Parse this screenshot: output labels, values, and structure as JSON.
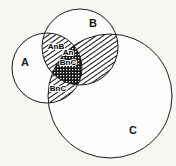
{
  "diagram": {
    "type": "venn-three-set",
    "title": "",
    "background_color": "#f7f6f3",
    "stroke_color": "#1a1a1a",
    "sets": [
      {
        "id": "A",
        "label": "A",
        "cx": 47,
        "cy": 68,
        "r": 35,
        "label_x": 25,
        "label_y": 63
      },
      {
        "id": "B",
        "label": "B",
        "cx": 80,
        "cy": 47,
        "r": 38,
        "label_x": 93,
        "label_y": 24
      },
      {
        "id": "C",
        "label": "C",
        "cx": 110,
        "cy": 96,
        "r": 62,
        "label_x": 133,
        "label_y": 131
      }
    ],
    "shaded_regions": [
      {
        "id": "A-int-B",
        "label_line_1": "AnB",
        "label_line_2": "",
        "fill_pattern": "diagonal-hatch",
        "label_x": 56,
        "label_y": 47
      },
      {
        "id": "A-int-B-int-C",
        "label_line_1": "An",
        "label_line_2": "BnC",
        "fill_pattern": "dense-stipple",
        "label_x": 68,
        "label_y": 58
      },
      {
        "id": "B-int-C",
        "label_line_1": "BnC",
        "label_line_2": "",
        "fill_pattern": "diagonal-hatch",
        "label_x": 58,
        "label_y": 89
      }
    ]
  }
}
